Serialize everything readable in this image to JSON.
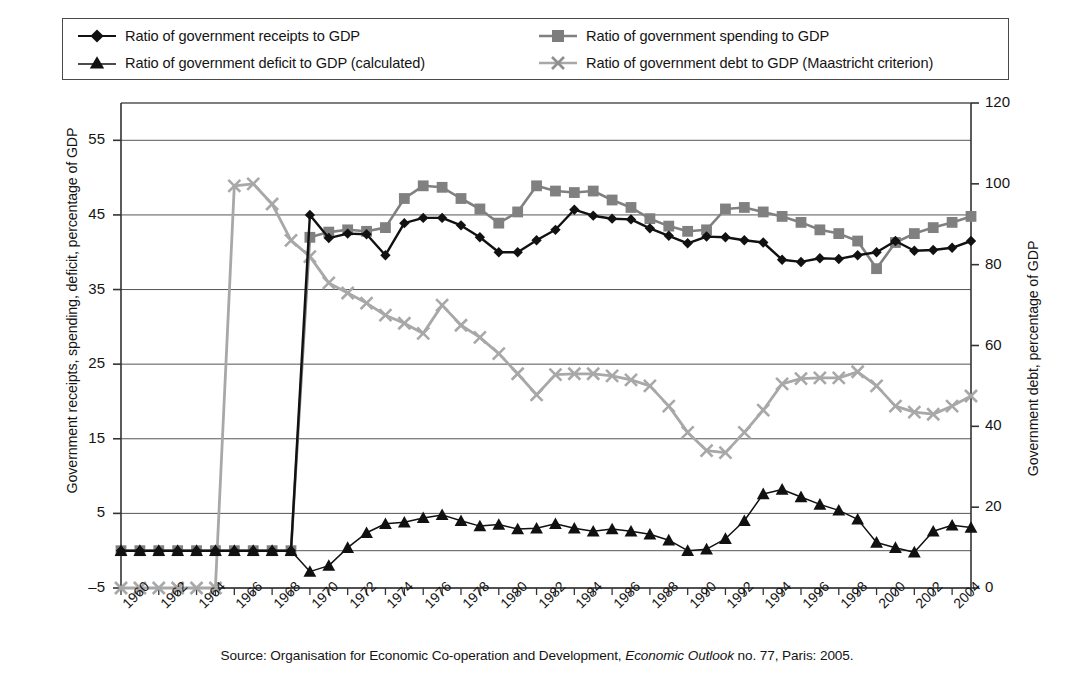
{
  "legend": {
    "entries": [
      {
        "label": "Ratio of government receipts to GDP",
        "marker": "diamond-marker-icon",
        "color": "#111111"
      },
      {
        "label": "Ratio of government spending to GDP",
        "marker": "square-marker-icon",
        "color": "#808080"
      },
      {
        "label": "Ratio of government deficit to GDP (calculated)",
        "marker": "triangle-marker-icon",
        "color": "#111111"
      },
      {
        "label": "Ratio of government debt to GDP (Maastricht criterion)",
        "marker": "cross-marker-icon",
        "color": "#a8a8a8"
      }
    ]
  },
  "source": {
    "prefix": "Source: Organisation for Economic Co-operation and Development, ",
    "italic": "Economic Outlook",
    "suffix": " no. 77, Paris: 2005."
  },
  "chart_data": {
    "type": "line",
    "title": "",
    "xlabel": "",
    "ylabel": "Government receipts, spending, deficit, percentage of GDP",
    "y2label": "Government debt, percentage of GDP",
    "ylim": [
      -5,
      60
    ],
    "y2lim": [
      0,
      120
    ],
    "yticks": [
      55,
      45,
      35,
      25,
      15,
      5,
      -5
    ],
    "y2ticks": [
      120,
      100,
      80,
      60,
      40,
      20,
      0
    ],
    "grid": true,
    "legend_position": "top",
    "x": [
      1960,
      1961,
      1962,
      1963,
      1964,
      1965,
      1966,
      1967,
      1968,
      1969,
      1970,
      1971,
      1972,
      1973,
      1974,
      1975,
      1976,
      1977,
      1978,
      1979,
      1980,
      1981,
      1982,
      1983,
      1984,
      1985,
      1986,
      1987,
      1988,
      1989,
      1990,
      1991,
      1992,
      1993,
      1994,
      1995,
      1996,
      1997,
      1998,
      1999,
      2000,
      2001,
      2002,
      2003,
      2004,
      2005
    ],
    "xticklabels": [
      "1960",
      "1962",
      "1964",
      "1966",
      "1968",
      "1970",
      "1972",
      "1974",
      "1976",
      "1978",
      "1980",
      "1982",
      "1984",
      "1986",
      "1988",
      "1990",
      "1992",
      "1994",
      "1996",
      "1998",
      "2000",
      "2002",
      "2004"
    ],
    "xticklabel_rotation": -45,
    "series": [
      {
        "name": "Ratio of government receipts to GDP",
        "axis": "left",
        "marker": "diamond",
        "color": "#111111",
        "values": [
          0,
          0,
          0,
          0,
          0,
          0,
          0,
          0,
          0,
          0,
          45.0,
          41.9,
          42.5,
          42.4,
          39.6,
          43.9,
          44.6,
          44.6,
          43.6,
          42.0,
          40.0,
          40.0,
          41.6,
          43.0,
          45.7,
          44.9,
          44.5,
          44.4,
          43.2,
          42.2,
          41.2,
          42.1,
          42.0,
          41.6,
          41.3,
          39.0,
          38.7,
          39.2,
          39.1,
          39.6,
          40.0,
          41.5,
          40.2,
          40.3,
          40.6,
          41.5
        ]
      },
      {
        "name": "Ratio of government spending to GDP",
        "axis": "left",
        "marker": "square",
        "color": "#808080",
        "values": [
          0,
          0,
          0,
          0,
          0,
          0,
          0,
          0,
          0,
          0,
          42.0,
          42.7,
          43.0,
          42.8,
          43.3,
          47.2,
          48.9,
          48.7,
          47.2,
          45.8,
          43.9,
          45.4,
          48.9,
          48.2,
          48.0,
          48.2,
          47.0,
          46.0,
          44.5,
          43.5,
          42.8,
          43.0,
          45.8,
          46.0,
          45.4,
          44.8,
          44.0,
          43.0,
          42.5,
          41.5,
          37.8,
          41.3,
          42.5,
          43.3,
          44.0,
          44.8
        ]
      },
      {
        "name": "Ratio of government deficit to GDP (calculated)",
        "axis": "left",
        "marker": "triangle",
        "color": "#111111",
        "values": [
          0,
          0,
          0,
          0,
          0,
          0,
          0,
          0,
          0,
          0,
          -2.8,
          -2.0,
          0.4,
          2.4,
          3.6,
          3.8,
          4.4,
          4.8,
          4.0,
          3.3,
          3.5,
          2.9,
          3.0,
          3.6,
          3.0,
          2.6,
          2.9,
          2.6,
          2.2,
          1.4,
          0.0,
          0.2,
          1.6,
          4.0,
          7.6,
          8.2,
          7.2,
          6.2,
          5.4,
          4.2,
          1.1,
          0.4,
          -0.2,
          2.6,
          3.4,
          3.1
        ]
      },
      {
        "name": "Ratio of government debt to GDP (Maastricht criterion)",
        "axis": "right",
        "marker": "cross",
        "color": "#a8a8a8",
        "values": [
          0,
          0,
          0,
          0,
          0,
          0,
          99.5,
          100.0,
          95.0,
          86.0,
          82.0,
          75.5,
          73.0,
          70.5,
          67.5,
          65.5,
          63.0,
          70.0,
          65.0,
          62.0,
          58.0,
          53.0,
          47.8,
          52.8,
          53.0,
          53.0,
          52.5,
          51.5,
          50.0,
          45.0,
          38.5,
          34.0,
          33.5,
          38.5,
          44.0,
          50.5,
          51.8,
          52.0,
          52.0,
          53.5,
          50.0,
          45.0,
          43.5,
          43.0,
          45.0,
          47.5
        ]
      }
    ]
  }
}
